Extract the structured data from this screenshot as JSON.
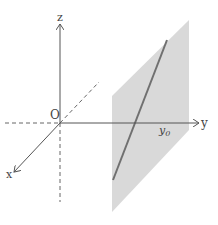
{
  "diagram": {
    "labels": {
      "z_axis": "z",
      "y_axis": "y",
      "x_axis": "x",
      "origin": "O",
      "y0": "y",
      "y0_sub": "0"
    },
    "colors": {
      "axis": "#555555",
      "plane": "#d9d9d9",
      "line": "#707070"
    }
  }
}
